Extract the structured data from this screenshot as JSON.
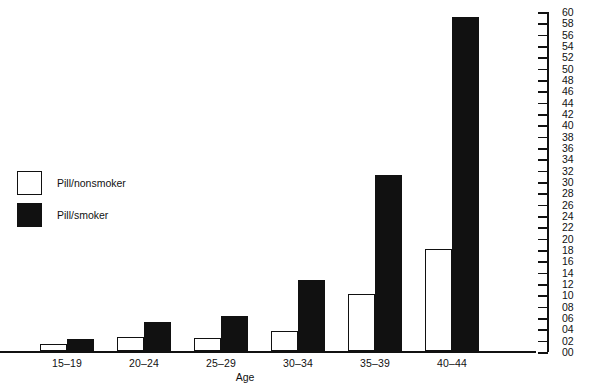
{
  "chart_data": {
    "type": "bar",
    "title": "",
    "xlabel": "Age",
    "ylabel": "",
    "categories": [
      "15–19",
      "20–24",
      "25–29",
      "30–34",
      "35–39",
      "40–44"
    ],
    "series": [
      {
        "name": "Pill/nonsmoker",
        "color": "#ffffff",
        "values": [
          1.2,
          2.5,
          2.3,
          3.5,
          10,
          18
        ]
      },
      {
        "name": "Pill/smoker",
        "color": "#111111",
        "values": [
          2.1,
          5.1,
          6.2,
          12.5,
          31,
          59
        ]
      }
    ],
    "ylim": [
      0,
      60
    ],
    "ytick_step": 2,
    "ytick_labels": [
      "60",
      "58",
      "56",
      "54",
      "52",
      "50",
      "48",
      "46",
      "44",
      "42",
      "40",
      "38",
      "36",
      "34",
      "32",
      "30",
      "28",
      "26",
      "24",
      "22",
      "20",
      "18",
      "16",
      "14",
      "12",
      "10",
      "08",
      "06",
      "04",
      "02",
      "00"
    ],
    "yaxis_position": "right",
    "grid": false,
    "legend_position": "left-middle"
  },
  "legend": {
    "entries": [
      {
        "label": "Pill/nonsmoker",
        "swatch": "white"
      },
      {
        "label": "Pill/smoker",
        "swatch": "black"
      }
    ]
  },
  "colors": {
    "ink": "#111111",
    "background": "#ffffff"
  }
}
